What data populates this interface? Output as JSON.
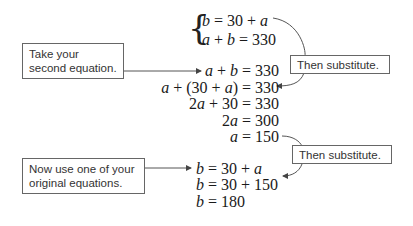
{
  "system": {
    "lines": [
      "b = 30 + a",
      "a + b = 330"
    ]
  },
  "solve_a": {
    "lines": [
      "a + b = 330",
      "a + (30 + a) = 330",
      "2a + 30 = 330",
      "2a = 300",
      "a = 150"
    ]
  },
  "solve_b": {
    "lines": [
      "b = 30 + a",
      "b = 30 + 150",
      "b = 180"
    ]
  },
  "callouts": {
    "take_second": "Take your second equation.",
    "then_substitute_1": "Then substitute.",
    "use_original": "Now use one of your original equations.",
    "then_substitute_2": "Then substitute."
  }
}
